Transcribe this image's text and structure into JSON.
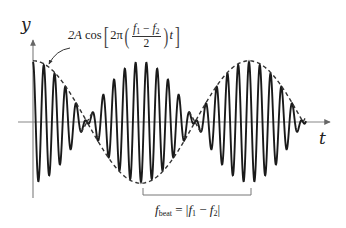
{
  "diagram": {
    "axes": {
      "y_label": "y",
      "x_label": "t"
    },
    "envelope_label": {
      "prefix": "2A cos",
      "inner_prefix": "2π",
      "fraction_numerator_f1": "f",
      "fraction_numerator_sub1": "1",
      "fraction_minus": " − ",
      "fraction_numerator_f2": "f",
      "fraction_numerator_sub2": "2",
      "fraction_denominator": "2",
      "suffix": "t"
    },
    "beat_label": {
      "f": "f",
      "sub": "beat",
      "equals": " = |",
      "f1": "f",
      "sub1": "1",
      "minus": " − ",
      "f2": "f",
      "sub2": "2",
      "close": "|"
    },
    "signal": {
      "x_start": 33,
      "x_end": 306,
      "baseline_y": 122,
      "amplitude": 60,
      "envelope_half_period_px": 108,
      "carrier_period_px": 10.8
    },
    "colors": {
      "wave": "#1a1a1a",
      "envelope": "#333333",
      "axis": "#888888",
      "text": "#222222"
    }
  }
}
